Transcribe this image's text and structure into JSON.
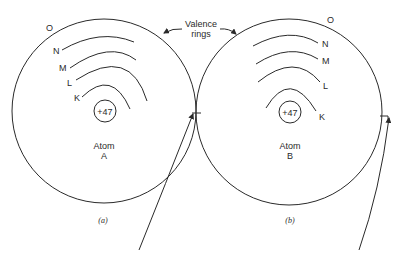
{
  "annotation": {
    "line1": "Valence",
    "line2": "rings"
  },
  "atoms": [
    {
      "name": "Atom",
      "id_letter": "A",
      "caption": "(a)",
      "nucleus": "+47",
      "shells": {
        "K": "K",
        "L": "L",
        "M": "M",
        "N": "N",
        "O": "O"
      }
    },
    {
      "name": "Atom",
      "id_letter": "B",
      "caption": "(b)",
      "nucleus": "+47",
      "shells": {
        "K": "K",
        "L": "L",
        "M": "M",
        "N": "N",
        "O": "O"
      }
    }
  ]
}
